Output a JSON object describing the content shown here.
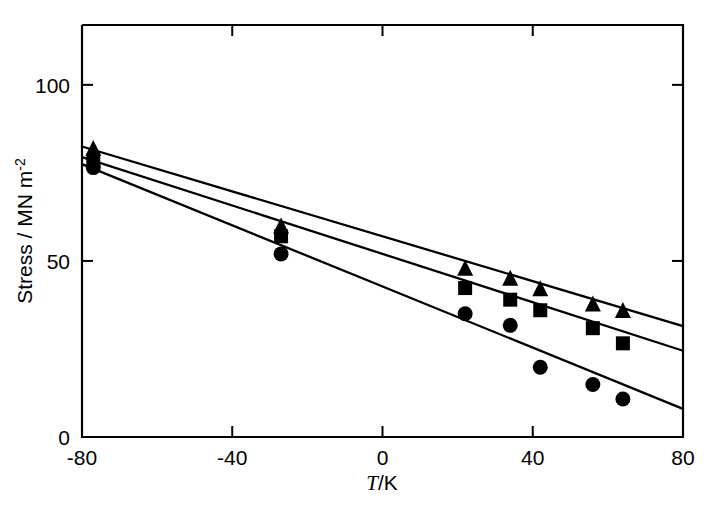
{
  "chart_data": {
    "type": "scatter",
    "title": "",
    "xlabel": "T/K",
    "ylabel": "Stress / MN m-2",
    "ylabel_parts": {
      "main": "Stress / MN m",
      "superscript": "-2"
    },
    "xlim": [
      -80,
      80
    ],
    "ylim": [
      0,
      117
    ],
    "xticks": [
      -80,
      -40,
      0,
      40,
      80
    ],
    "xticklabels": [
      "-80",
      "-40",
      "0",
      "40",
      "80"
    ],
    "yticks": [
      0,
      50,
      100
    ],
    "yticklabels": [
      "0",
      "50",
      "100"
    ],
    "grid": false,
    "legend": "none",
    "axis_frame": "box",
    "tick_direction": "in",
    "series": [
      {
        "name": "triangle-series",
        "marker": "triangle",
        "color": "#000000",
        "x": [
          -77,
          -27,
          22,
          34,
          42,
          56,
          64
        ],
        "y": [
          81.5,
          59.5,
          47.5,
          44.7,
          41.7,
          37.4,
          35.5
        ],
        "fit_line": {
          "x0": -80,
          "y0": 82.5,
          "x1": 80,
          "y1": 31.5
        }
      },
      {
        "name": "square-series",
        "marker": "square",
        "color": "#000000",
        "x": [
          -77,
          -27,
          22,
          34,
          42,
          56,
          64
        ],
        "y": [
          78.5,
          57.0,
          42.3,
          39.0,
          36.0,
          30.9,
          26.6
        ],
        "fit_line": {
          "x0": -80,
          "y0": 79.5,
          "x1": 80,
          "y1": 24.5
        }
      },
      {
        "name": "circle-series",
        "marker": "circle",
        "color": "#000000",
        "x": [
          -77,
          -27,
          22,
          34,
          42,
          56,
          64
        ],
        "y": [
          76.5,
          52.0,
          35.0,
          31.7,
          19.8,
          14.9,
          10.8
        ],
        "fit_line": {
          "x0": -80,
          "y0": 77.5,
          "x1": 80,
          "y1": 8.0
        }
      }
    ]
  },
  "figure": {
    "background": "#ffffff",
    "ink": "#000000"
  }
}
